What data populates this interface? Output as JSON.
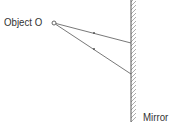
{
  "diagram": {
    "type": "plane-mirror-ray-diagram",
    "object_label": "Object O",
    "mirror_label": "Mirror",
    "colors": {
      "line": "#555555",
      "hatch": "#8a8a8a",
      "text": "#333333"
    },
    "object_point": {
      "x": 54,
      "y": 23
    },
    "mirror": {
      "x": 131,
      "y_top": 0,
      "y_bottom": 122
    },
    "rays": [
      {
        "from": {
          "x": 54,
          "y": 23
        },
        "to": {
          "x": 131,
          "y": 43
        },
        "arrow_at": {
          "x": 94,
          "y": 33
        }
      },
      {
        "from": {
          "x": 54,
          "y": 23
        },
        "to": {
          "x": 131,
          "y": 74
        },
        "arrow_at": {
          "x": 94,
          "y": 49
        }
      }
    ]
  }
}
